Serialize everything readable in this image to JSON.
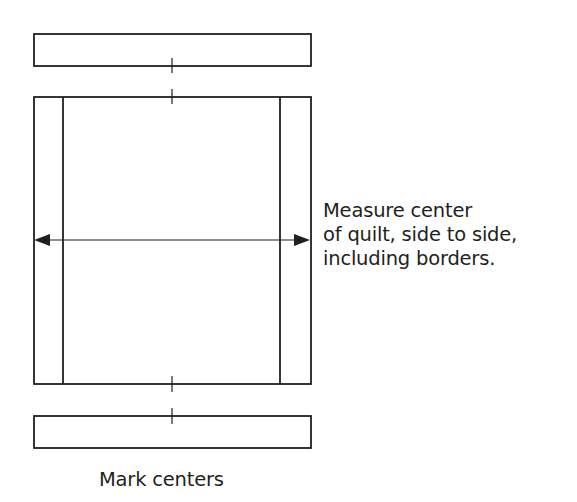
{
  "diagram": {
    "type": "quilt-border-measuring-instructions",
    "stroke_color": "#231f20",
    "background_color": "#ffffff",
    "shapes": {
      "top_border_strip": {
        "x": 34,
        "y": 34,
        "w": 277,
        "h": 32
      },
      "quilt_top": {
        "x": 34,
        "y": 97,
        "w": 277,
        "h": 287
      },
      "left_border_line_x": 63,
      "right_border_line_x": 280,
      "bottom_border_strip": {
        "x": 34,
        "y": 416,
        "w": 277,
        "h": 32
      },
      "center_mark_x": 172,
      "measure_arrow_y": 240
    },
    "labels": {
      "side_line_1": "Measure center",
      "side_line_2": "of quilt, side to side,",
      "side_line_3": "including borders.",
      "bottom": "Mark centers"
    }
  }
}
